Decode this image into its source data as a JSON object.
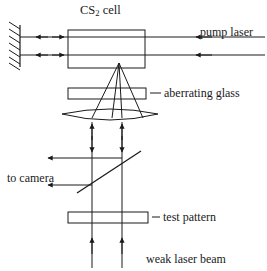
{
  "figure": {
    "background_color": "#ffffff",
    "stroke_color": "#1a1a1a",
    "width": 267,
    "height": 271
  },
  "labels": {
    "cs2_cell_pre": "CS",
    "cs2_cell_sub": "2",
    "cs2_cell_post": " cell",
    "pump_laser": "pump laser",
    "aberrating_glass": "aberrating glass",
    "to_camera": "to camera",
    "test_pattern": "test pattern",
    "weak_laser_beam": "weak laser beam"
  },
  "components": [
    {
      "name": "mirror",
      "type": "hatched-mirror",
      "x": 18,
      "y1": 26,
      "y2": 66
    },
    {
      "name": "cs2-cell",
      "type": "rectangle",
      "x": 68,
      "y": 30,
      "w": 77,
      "h": 38
    },
    {
      "name": "aberrating-glass",
      "type": "rectangle",
      "x": 68,
      "y": 88,
      "w": 78,
      "h": 11
    },
    {
      "name": "lens",
      "type": "biconvex-lens",
      "x1": 62,
      "x2": 158,
      "y": 118
    },
    {
      "name": "beamsplitter",
      "type": "diagonal-line",
      "x1": 78,
      "y1": 192,
      "x2": 140,
      "y2": 152
    },
    {
      "name": "test-pattern",
      "type": "rectangle",
      "x": 68,
      "y": 212,
      "w": 80,
      "h": 11
    }
  ],
  "beams": [
    {
      "name": "pump-beam-upper",
      "orientation": "horizontal",
      "y": 37,
      "direction": "leftward"
    },
    {
      "name": "pump-beam-lower",
      "orientation": "horizontal",
      "y": 55,
      "direction": "leftward"
    },
    {
      "name": "signal-beam-left",
      "orientation": "vertical",
      "x": 92,
      "direction": "bidirectional"
    },
    {
      "name": "signal-beam-right",
      "orientation": "vertical",
      "x": 122,
      "direction": "bidirectional"
    },
    {
      "name": "camera-beam-upper",
      "orientation": "horizontal",
      "y": 158,
      "direction": "leftward"
    },
    {
      "name": "camera-beam-lower",
      "orientation": "horizontal",
      "y": 185,
      "direction": "leftward"
    },
    {
      "name": "converging-beam",
      "orientation": "cone",
      "apex_x": 119,
      "apex_y": 63
    }
  ]
}
